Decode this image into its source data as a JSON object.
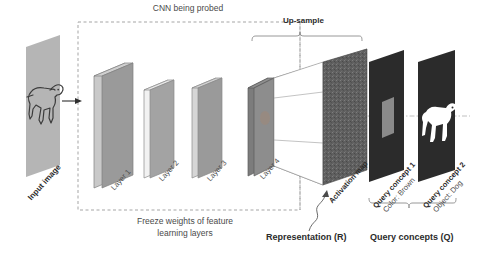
{
  "diagram": {
    "title_top": "CNN being probed",
    "upsample_label": "Up-sample",
    "freeze_caption_line1": "Freeze weights of feature",
    "freeze_caption_line2": "learning layers",
    "representation_label": "Representation (R)",
    "query_concepts_label": "Query concepts (Q)",
    "input_label": "Input image",
    "activation_label": "Activation map",
    "layers": [
      {
        "name": "Layer 1",
        "face_color": "#9a9a9a",
        "edge_color": "#c9c9c9"
      },
      {
        "name": "Layer 2",
        "face_color": "#a0a0a0",
        "edge_color": "#f2f2f2"
      },
      {
        "name": "Layer 3",
        "face_color": "#9a9a9a",
        "edge_color": "#d6d6d6"
      },
      {
        "name": "Layer 4",
        "face_color": "#8d8d8d",
        "edge_color": "#7c7c7c"
      }
    ],
    "queries": [
      {
        "title": "Query concept 1",
        "subtitle": "Color: Brown",
        "panel_color": "#2b2b2b",
        "patch_color": "#8a8a8a"
      },
      {
        "title": "Query concept 2",
        "subtitle": "Object: Dog",
        "panel_color": "#2b2b2b",
        "patch_color": "#ffffff"
      }
    ],
    "colors": {
      "input_plane": "#b5b5b5",
      "activation_map": "#5f5f5f",
      "dashed_border": "#9d9d9d",
      "line": "#6f6f6f",
      "text": "#4a4a4a",
      "text_bold": "#2b2b2b"
    }
  }
}
